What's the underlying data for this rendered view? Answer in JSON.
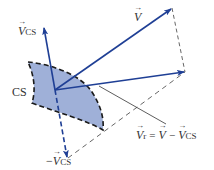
{
  "diagram": {
    "colors": {
      "vector": "#1f3f95",
      "patch_fill": "#9fb0d8",
      "patch_border": "#1a1a1a",
      "construction": "#555555",
      "text": "#333333"
    },
    "labels": {
      "v_cs": {
        "symbol": "V",
        "subscript": "CS"
      },
      "v": {
        "symbol": "V"
      },
      "cs": "CS",
      "neg_v_cs": {
        "prefix": "−",
        "symbol": "V",
        "subscript": "CS"
      },
      "equation": {
        "lhs_symbol": "V",
        "lhs_subscript": "r",
        "equals": "=",
        "term1_symbol": "V",
        "minus": "−",
        "term2_symbol": "V",
        "term2_subscript": "CS"
      }
    },
    "geometry": {
      "origin": [
        55,
        90
      ],
      "v_cs_tip": [
        44,
        27
      ],
      "v_tip": [
        172,
        8
      ],
      "v_r_tip": [
        185,
        72
      ],
      "neg_v_cs_tip": [
        68,
        158
      ]
    }
  }
}
